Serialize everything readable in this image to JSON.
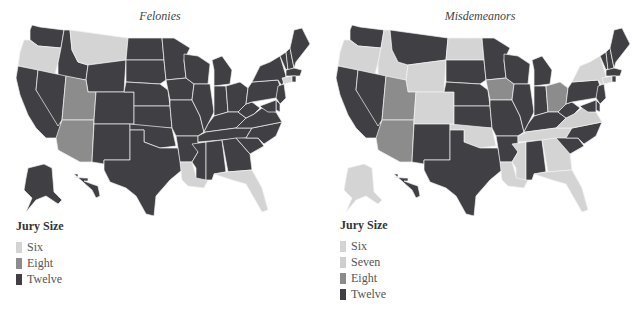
{
  "colors": {
    "six": "#d4d4d4",
    "seven": "#cfcfcf",
    "eight": "#8c8c8c",
    "twelve": "#404044"
  },
  "maps": [
    {
      "title": "Felonies",
      "legend": {
        "title": "Jury Size",
        "items": [
          {
            "label": "Six",
            "key": "six"
          },
          {
            "label": "Eight",
            "key": "eight"
          },
          {
            "label": "Twelve",
            "key": "twelve"
          }
        ]
      },
      "states": {
        "WA": "twelve",
        "OR": "six",
        "CA": "twelve",
        "ID": "twelve",
        "NV": "twelve",
        "MT": "six",
        "WY": "twelve",
        "UT": "eight",
        "AZ": "eight",
        "CO": "twelve",
        "NM": "twelve",
        "ND": "twelve",
        "SD": "twelve",
        "NE": "twelve",
        "KS": "twelve",
        "OK": "twelve",
        "TX": "twelve",
        "MN": "twelve",
        "IA": "twelve",
        "MO": "twelve",
        "AR": "twelve",
        "LA": "six",
        "WI": "twelve",
        "IL": "twelve",
        "MI": "twelve",
        "IN": "twelve",
        "OH": "twelve",
        "KY": "twelve",
        "TN": "twelve",
        "MS": "twelve",
        "AL": "twelve",
        "GA": "twelve",
        "FL": "six",
        "SC": "twelve",
        "NC": "twelve",
        "VA": "twelve",
        "WV": "twelve",
        "PA": "twelve",
        "NY": "twelve",
        "VT": "twelve",
        "NH": "twelve",
        "ME": "twelve",
        "MA": "twelve",
        "CT": "six",
        "RI": "twelve",
        "NJ": "twelve",
        "DE": "twelve",
        "MD": "twelve",
        "AK": "twelve",
        "HI": "twelve"
      }
    },
    {
      "title": "Misdemeanors",
      "legend": {
        "title": "Jury Size",
        "items": [
          {
            "label": "Six",
            "key": "six"
          },
          {
            "label": "Seven",
            "key": "seven"
          },
          {
            "label": "Eight",
            "key": "eight"
          },
          {
            "label": "Twelve",
            "key": "twelve"
          }
        ]
      },
      "states": {
        "WA": "twelve",
        "OR": "six",
        "CA": "twelve",
        "ID": "six",
        "NV": "twelve",
        "MT": "twelve",
        "WY": "six",
        "UT": "eight",
        "AZ": "eight",
        "CO": "six",
        "NM": "twelve",
        "ND": "six",
        "SD": "twelve",
        "NE": "twelve",
        "KS": "twelve",
        "OK": "six",
        "TX": "twelve",
        "MN": "twelve",
        "IA": "eight",
        "MO": "twelve",
        "AR": "twelve",
        "LA": "six",
        "WI": "twelve",
        "IL": "twelve",
        "MI": "twelve",
        "IN": "twelve",
        "OH": "eight",
        "KY": "twelve",
        "TN": "six",
        "MS": "six",
        "AL": "twelve",
        "GA": "six",
        "FL": "six",
        "SC": "twelve",
        "NC": "twelve",
        "VA": "seven",
        "WV": "twelve",
        "PA": "twelve",
        "NY": "six",
        "VT": "twelve",
        "NH": "twelve",
        "ME": "twelve",
        "MA": "twelve",
        "CT": "six",
        "RI": "twelve",
        "NJ": "twelve",
        "DE": "twelve",
        "MD": "twelve",
        "AK": "six",
        "HI": "twelve"
      }
    }
  ]
}
